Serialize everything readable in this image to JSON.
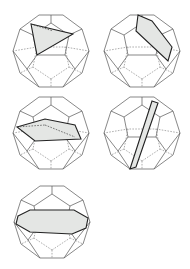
{
  "figure": {
    "colors": {
      "edge": "#555555",
      "section_fill": "#e4e6e4",
      "section_edge": "#222222"
    },
    "panels": [
      {
        "id": "a",
        "cx": 51,
        "cy": 51,
        "section_shape": "triangle"
      },
      {
        "id": "b",
        "cx": 142,
        "cy": 51,
        "section_shape": "quadrilateral"
      },
      {
        "id": "c",
        "cx": 51,
        "cy": 133,
        "section_shape": "pentagon"
      },
      {
        "id": "d",
        "cx": 142,
        "cy": 133,
        "section_shape": "thin-quadrilateral"
      },
      {
        "id": "e",
        "cx": 52,
        "cy": 222,
        "section_shape": "hexagon"
      }
    ]
  }
}
